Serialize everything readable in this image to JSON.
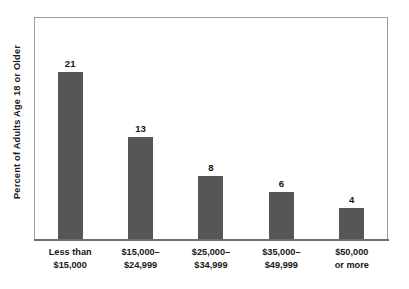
{
  "chart_data": {
    "type": "bar",
    "title": "",
    "subtitle": "",
    "xlabel": "",
    "ylabel": "Percent of Adults Age 18 or Older",
    "categories": [
      "Less than $15,000",
      "$15,000–$24,999",
      "$25,000–$34,999",
      "$35,000–$49,999",
      "$50,000 or more"
    ],
    "category_lines": [
      [
        "Less than",
        "$15,000"
      ],
      [
        "$15,000–",
        "$24,999"
      ],
      [
        "$25,000–",
        "$34,999"
      ],
      [
        "$35,000–",
        "$49,999"
      ],
      [
        "$50,000",
        "or more"
      ]
    ],
    "values": [
      21,
      13,
      8,
      6,
      4
    ],
    "value_labels": [
      "21",
      "13",
      "8",
      "6",
      "4"
    ],
    "ylim": [
      0,
      27
    ],
    "grid": false,
    "legend": false,
    "legend_position": "none",
    "orientation": "vertical",
    "bar_color": "#565656",
    "frame_color": "#9e9e9e",
    "axis_color": "#6f6f6f",
    "background_color": "#ffffff"
  },
  "bars": [
    {
      "label_line1": "Less than",
      "label_line2": "$15,000",
      "value": 21,
      "value_label": "21",
      "height_px": 168
    },
    {
      "label_line1": "$15,000–",
      "label_line2": "$24,999",
      "value": 13,
      "value_label": "13",
      "height_px": 103
    },
    {
      "label_line1": "$25,000–",
      "label_line2": "$34,999",
      "value": 8,
      "value_label": "8",
      "height_px": 64
    },
    {
      "label_line1": "$35,000–",
      "label_line2": "$49,999",
      "value": 6,
      "value_label": "6",
      "height_px": 48
    },
    {
      "label_line1": "$50,000",
      "label_line2": "or more",
      "value": 4,
      "value_label": "4",
      "height_px": 32
    }
  ]
}
